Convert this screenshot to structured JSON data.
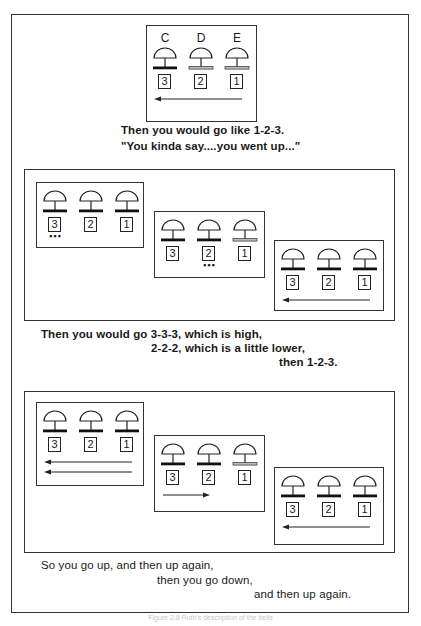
{
  "figure": {
    "panel1": {
      "note_labels": [
        "C",
        "D",
        "E"
      ],
      "bells": [
        {
          "number": "3",
          "bar": "dark"
        },
        {
          "number": "2",
          "bar": "light"
        },
        {
          "number": "1",
          "bar": "light"
        }
      ],
      "arrows": [
        "left"
      ],
      "text_lines": [
        "Then you would go like 1-2-3.",
        "\"You kinda say....you went up...\""
      ]
    },
    "panel2": {
      "groups": [
        {
          "bells": [
            {
              "number": "3",
              "bar": "dark"
            },
            {
              "number": "2",
              "bar": "dark"
            },
            {
              "number": "1",
              "bar": "dark"
            }
          ],
          "dots_under": 0,
          "arrows": []
        },
        {
          "bells": [
            {
              "number": "3",
              "bar": "dark"
            },
            {
              "number": "2",
              "bar": "dark"
            },
            {
              "number": "1",
              "bar": "light"
            }
          ],
          "dots_under": 1,
          "arrows": []
        },
        {
          "bells": [
            {
              "number": "3",
              "bar": "dark"
            },
            {
              "number": "2",
              "bar": "dark"
            },
            {
              "number": "1",
              "bar": "dark"
            }
          ],
          "dots_under": -1,
          "arrows": [
            "left"
          ]
        }
      ],
      "text_lines": [
        "Then you would go 3-3-3, which is high,",
        "2-2-2, which is a little lower,",
        "then 1-2-3."
      ]
    },
    "panel3": {
      "groups": [
        {
          "bells": [
            {
              "number": "3",
              "bar": "dark"
            },
            {
              "number": "2",
              "bar": "dark"
            },
            {
              "number": "1",
              "bar": "dark"
            }
          ],
          "arrows": [
            "left",
            "left"
          ]
        },
        {
          "bells": [
            {
              "number": "3",
              "bar": "dark"
            },
            {
              "number": "2",
              "bar": "dark"
            },
            {
              "number": "1",
              "bar": "light"
            }
          ],
          "arrows": [
            "right"
          ]
        },
        {
          "bells": [
            {
              "number": "3",
              "bar": "dark"
            },
            {
              "number": "2",
              "bar": "dark"
            },
            {
              "number": "1",
              "bar": "dark"
            }
          ],
          "arrows": [
            "left"
          ]
        }
      ],
      "text_lines": [
        "So you go up, and then up again,",
        "then you go down,",
        "and then up again."
      ]
    },
    "caption": "Figure 2.8  Ruth's description of the bells"
  }
}
